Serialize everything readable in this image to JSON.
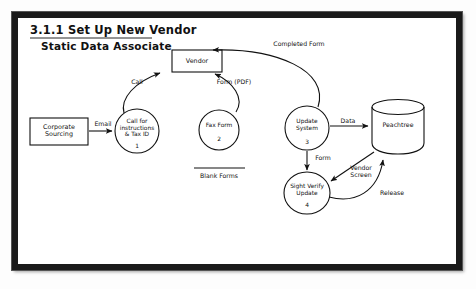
{
  "diagram": {
    "type": "data-flow-diagram",
    "title": "3.1.1 Set Up New Vendor",
    "subtitle": "Static Data Associate",
    "stroke_color": "#111111",
    "frame_color": "#1a1a1a",
    "background": "#ffffff",
    "external_entities": [
      {
        "id": "corporate-sourcing",
        "label": "Corporate\nSourcing",
        "shape": "rectangle",
        "x": 59,
        "y": 131,
        "w": 58,
        "h": 27
      },
      {
        "id": "vendor",
        "label": "Vendor",
        "shape": "rectangle",
        "x": 197,
        "y": 61,
        "w": 50,
        "h": 22
      }
    ],
    "processes": [
      {
        "number": "1",
        "label": "Call for\ninstructions\n& Tax ID",
        "shape": "circle",
        "x": 137,
        "y": 131,
        "r": 22
      },
      {
        "number": "2",
        "label": "Fax Form",
        "shape": "circle",
        "x": 219,
        "y": 130,
        "r": 20
      },
      {
        "number": "3",
        "label": "Update\nSystem",
        "shape": "circle",
        "x": 307,
        "y": 128,
        "r": 22
      },
      {
        "number": "4",
        "label": "Sight Verify\nUpdate",
        "shape": "circle",
        "x": 307,
        "y": 193,
        "r": 22
      }
    ],
    "data_stores": [
      {
        "id": "blank-forms",
        "label": "Blank Forms",
        "shape": "open-line",
        "x": 219,
        "y": 168
      },
      {
        "id": "peachtree",
        "label": "Peachtree",
        "shape": "cylinder",
        "x": 398,
        "y": 125,
        "w": 52,
        "h": 50
      }
    ],
    "flows": [
      {
        "id": "email",
        "label": "Email",
        "from": "corporate-sourcing",
        "to": "1",
        "x": 103,
        "y": 124
      },
      {
        "id": "call",
        "label": "Call",
        "from": "1",
        "to": "vendor",
        "x": 137,
        "y": 82
      },
      {
        "id": "form-pdf",
        "label": "Form (PDF)",
        "from": "vendor",
        "to": "2",
        "x": 234,
        "y": 82
      },
      {
        "id": "completed-form",
        "label": "Completed Form",
        "from": "3",
        "to": "vendor",
        "x": 299,
        "y": 44
      },
      {
        "id": "data",
        "label": "Data",
        "from": "3",
        "to": "peachtree",
        "x": 348,
        "y": 121
      },
      {
        "id": "form",
        "label": "Form",
        "from": "3",
        "to": "4",
        "x": 323,
        "y": 158
      },
      {
        "id": "vendor-screen",
        "label": "Vendor\nScreen",
        "from": "peachtree",
        "to": "4",
        "x": 361,
        "y": 171
      },
      {
        "id": "release",
        "label": "Release",
        "from": "4",
        "to": "peachtree",
        "x": 392,
        "y": 193
      }
    ]
  }
}
